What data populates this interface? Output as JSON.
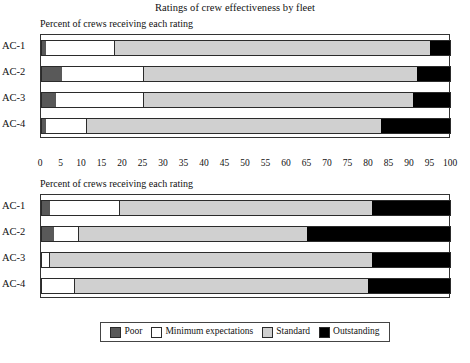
{
  "chart_data": {
    "type": "bar",
    "title": "Ratings of crew effectiveness by fleet",
    "orientation": "horizontal",
    "stacked": true,
    "xlabel": "",
    "ylabel": "",
    "xlim": [
      0,
      100
    ],
    "xticks": [
      0,
      5,
      10,
      15,
      20,
      25,
      30,
      35,
      40,
      45,
      50,
      55,
      60,
      65,
      70,
      75,
      80,
      85,
      90,
      95,
      100
    ],
    "grid": false,
    "legend_position": "bottom",
    "legend": [
      {
        "label": "Poor",
        "color": "#595959"
      },
      {
        "label": "Minimum expectations",
        "color": "#ffffff"
      },
      {
        "label": "Standard",
        "color": "#d0d0d0"
      },
      {
        "label": "Outstanding",
        "color": "#000000"
      }
    ],
    "panels": [
      {
        "subtitle": "Percent of crews receiving each rating",
        "categories": [
          "AC-1",
          "AC-2",
          "AC-3",
          "AC-4"
        ],
        "series": [
          {
            "name": "Poor",
            "values": [
              1,
              5,
              3.5,
              1
            ]
          },
          {
            "name": "Minimum expectations",
            "values": [
              17,
              20,
              21.5,
              10
            ]
          },
          {
            "name": "Standard",
            "values": [
              77,
              67,
              66,
              72
            ]
          },
          {
            "name": "Outstanding",
            "values": [
              5,
              8,
              9,
              17
            ]
          }
        ]
      },
      {
        "subtitle": "Percent of crews receiving each rating",
        "categories": [
          "AC-1",
          "AC-2",
          "AC-3",
          "AC-4"
        ],
        "series": [
          {
            "name": "Poor",
            "values": [
              2,
              3,
              0,
              0
            ]
          },
          {
            "name": "Minimum expectations",
            "values": [
              17,
              6,
              2,
              8
            ]
          },
          {
            "name": "Standard",
            "values": [
              62,
              56,
              79,
              72
            ]
          },
          {
            "name": "Outstanding",
            "values": [
              19,
              35,
              19,
              20
            ]
          }
        ]
      }
    ]
  },
  "figure": {
    "title": "Ratings of crew effectiveness by fleet"
  }
}
